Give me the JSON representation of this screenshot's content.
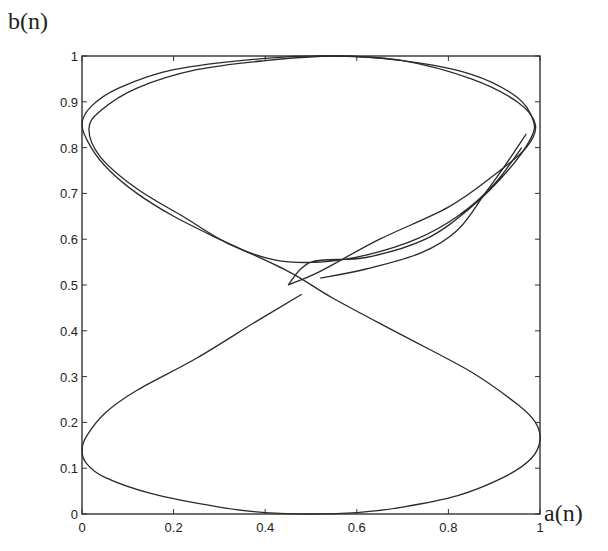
{
  "chart_data": {
    "type": "line",
    "title": "",
    "xlabel": "a(n)",
    "ylabel": "b(n)",
    "xlim": [
      0,
      1
    ],
    "ylim": [
      0,
      1
    ],
    "grid": false,
    "legend": null,
    "x_ticks": [
      "0",
      "0.2",
      "0.4",
      "0.6",
      "0.8",
      "1"
    ],
    "y_ticks": [
      "0",
      "0.1",
      "0.2",
      "0.3",
      "0.4",
      "0.5",
      "0.6",
      "0.7",
      "0.8",
      "0.9",
      "1"
    ],
    "series": [
      {
        "name": "trajectory",
        "description": "Phase-plane trajectory of (a(n), b(n)) forming an hourglass / figure-8 shape; upper loop traced several times with slight offsets",
        "points": [
          [
            0.48,
            0.48
          ],
          [
            0.38,
            0.42
          ],
          [
            0.25,
            0.34
          ],
          [
            0.12,
            0.27
          ],
          [
            0.05,
            0.22
          ],
          [
            0.01,
            0.17
          ],
          [
            0.0,
            0.14
          ],
          [
            0.01,
            0.11
          ],
          [
            0.05,
            0.08
          ],
          [
            0.15,
            0.045
          ],
          [
            0.3,
            0.015
          ],
          [
            0.4,
            0.003
          ],
          [
            0.5,
            0.0
          ],
          [
            0.6,
            0.003
          ],
          [
            0.7,
            0.015
          ],
          [
            0.82,
            0.04
          ],
          [
            0.92,
            0.08
          ],
          [
            0.98,
            0.12
          ],
          [
            1.0,
            0.16
          ],
          [
            0.99,
            0.2
          ],
          [
            0.95,
            0.24
          ],
          [
            0.85,
            0.31
          ],
          [
            0.7,
            0.39
          ],
          [
            0.55,
            0.47
          ],
          [
            0.45,
            0.53
          ],
          [
            0.3,
            0.6
          ],
          [
            0.2,
            0.65
          ],
          [
            0.12,
            0.7
          ],
          [
            0.06,
            0.75
          ],
          [
            0.02,
            0.8
          ],
          [
            0.0,
            0.85
          ],
          [
            0.02,
            0.89
          ],
          [
            0.08,
            0.93
          ],
          [
            0.2,
            0.97
          ],
          [
            0.4,
            0.995
          ],
          [
            0.55,
            1.0
          ],
          [
            0.7,
            0.99
          ],
          [
            0.85,
            0.95
          ],
          [
            0.95,
            0.9
          ],
          [
            0.99,
            0.85
          ],
          [
            0.97,
            0.8
          ],
          [
            0.9,
            0.74
          ],
          [
            0.8,
            0.67
          ],
          [
            0.65,
            0.6
          ],
          [
            0.52,
            0.53
          ],
          [
            0.45,
            0.5
          ]
        ]
      },
      {
        "name": "upper-loop-pass-2",
        "points": [
          [
            0.45,
            0.5
          ],
          [
            0.5,
            0.55
          ],
          [
            0.62,
            0.56
          ],
          [
            0.75,
            0.6
          ],
          [
            0.85,
            0.67
          ],
          [
            0.93,
            0.75
          ],
          [
            0.98,
            0.82
          ],
          [
            0.985,
            0.86
          ],
          [
            0.95,
            0.91
          ],
          [
            0.85,
            0.96
          ],
          [
            0.7,
            0.99
          ],
          [
            0.55,
            1.0
          ],
          [
            0.4,
            0.99
          ],
          [
            0.25,
            0.97
          ],
          [
            0.12,
            0.93
          ],
          [
            0.04,
            0.88
          ],
          [
            0.015,
            0.84
          ],
          [
            0.04,
            0.78
          ],
          [
            0.12,
            0.71
          ],
          [
            0.22,
            0.65
          ],
          [
            0.32,
            0.59
          ],
          [
            0.42,
            0.555
          ],
          [
            0.52,
            0.55
          ],
          [
            0.62,
            0.565
          ],
          [
            0.73,
            0.6
          ],
          [
            0.82,
            0.65
          ],
          [
            0.9,
            0.72
          ],
          [
            0.96,
            0.8
          ]
        ]
      },
      {
        "name": "upper-loop-pass-3",
        "points": [
          [
            0.52,
            0.515
          ],
          [
            0.62,
            0.535
          ],
          [
            0.74,
            0.57
          ],
          [
            0.82,
            0.62
          ],
          [
            0.88,
            0.7
          ],
          [
            0.93,
            0.77
          ],
          [
            0.97,
            0.83
          ]
        ]
      }
    ]
  },
  "axes": {
    "x_label": "a(n)",
    "y_label": "b(n)"
  }
}
